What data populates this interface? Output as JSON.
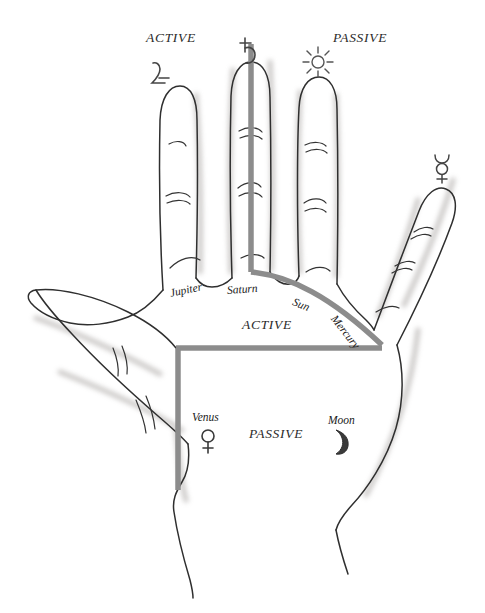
{
  "diagram": {
    "ink_color": "#2b2b2b",
    "divider_color": "#8c8c8c",
    "background": "#ffffff"
  },
  "zones": {
    "top_left": "ACTIVE",
    "top_right": "PASSIVE",
    "palm_upper": "ACTIVE",
    "palm_lower": "PASSIVE"
  },
  "fingers": [
    {
      "name": "Jupiter",
      "label": "Jupiter",
      "symbol": "♃",
      "symbol_name": "jupiter-symbol"
    },
    {
      "name": "Saturn",
      "label": "Saturn",
      "symbol": "♄",
      "symbol_name": "saturn-symbol"
    },
    {
      "name": "Sun",
      "label": "Sun",
      "symbol": "☼",
      "symbol_name": "sun-symbol"
    },
    {
      "name": "Mercury",
      "label": "Mercury",
      "symbol": "☿",
      "symbol_name": "mercury-symbol"
    }
  ],
  "mounts": [
    {
      "name": "Venus",
      "label": "Venus",
      "symbol": "♀",
      "symbol_name": "venus-symbol"
    },
    {
      "name": "Moon",
      "label": "Moon",
      "symbol": "☽",
      "symbol_name": "moon-symbol"
    }
  ]
}
